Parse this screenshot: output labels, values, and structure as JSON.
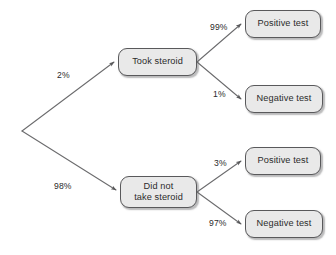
{
  "diagram": {
    "type": "probability-tree",
    "title": "",
    "background_color": "#ffffff",
    "node_fill_color": "#e9e9e9",
    "node_border_color": "#59595b",
    "edge_color": "#6b6b6d",
    "text_color": "#2b2b2b",
    "root": {
      "label": "",
      "x": 22,
      "y": 131
    },
    "nodes": [
      {
        "id": "took-steroid",
        "label": "Took steroid",
        "level": 1,
        "x": 118,
        "y": 48,
        "width": 79,
        "height": 28
      },
      {
        "id": "did-not-take-steroid",
        "label": "Did not\ntake steroid",
        "level": 1,
        "x": 120,
        "y": 176,
        "width": 77,
        "height": 32
      },
      {
        "id": "took-positive",
        "label": "Positive test",
        "level": 2,
        "x": 245,
        "y": 10,
        "width": 76,
        "height": 28
      },
      {
        "id": "took-negative",
        "label": "Negative test",
        "level": 2,
        "x": 245,
        "y": 85,
        "width": 78,
        "height": 28
      },
      {
        "id": "not-positive",
        "label": "Positive test",
        "level": 2,
        "x": 245,
        "y": 147,
        "width": 76,
        "height": 28
      },
      {
        "id": "not-negative",
        "label": "Negative test",
        "level": 2,
        "x": 245,
        "y": 210,
        "width": 78,
        "height": 28
      }
    ],
    "edges": [
      {
        "id": "root-to-took",
        "from": "root",
        "to": "took-steroid",
        "label": "2%",
        "label_x": 57,
        "label_y": 70
      },
      {
        "id": "root-to-not",
        "from": "root",
        "to": "did-not-take-steroid",
        "label": "98%",
        "label_x": 54,
        "label_y": 181
      },
      {
        "id": "took-to-positive",
        "from": "took-steroid",
        "to": "took-positive",
        "label": "99%",
        "label_x": 210,
        "label_y": 22
      },
      {
        "id": "took-to-negative",
        "from": "took-steroid",
        "to": "took-negative",
        "label": "1%",
        "label_x": 213,
        "label_y": 89
      },
      {
        "id": "not-to-positive",
        "from": "did-not-take-steroid",
        "to": "not-positive",
        "label": "3%",
        "label_x": 214,
        "label_y": 158
      },
      {
        "id": "not-to-negative",
        "from": "did-not-take-steroid",
        "to": "not-negative",
        "label": "97%",
        "label_x": 209,
        "label_y": 218
      }
    ]
  }
}
